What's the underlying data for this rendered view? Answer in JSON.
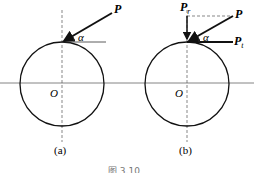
{
  "figure": {
    "caption": "图 3.10",
    "panels": [
      {
        "id": "a",
        "label": "(a)",
        "center_label": "O",
        "force_label": "P",
        "angle_label": "α"
      },
      {
        "id": "b",
        "label": "(b)",
        "center_label": "O",
        "force_label": "P",
        "angle_label": "α",
        "radial_label": "P",
        "radial_sub": "r",
        "tangential_label": "P",
        "tangential_sub": "t"
      }
    ]
  }
}
